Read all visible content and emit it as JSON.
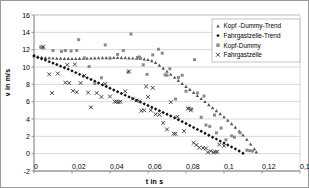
{
  "chart_data": {
    "type": "scatter",
    "title": "",
    "xlabel": "t in s",
    "ylabel": "v in m/s",
    "xlim": [
      0,
      0.14
    ],
    "ylim": [
      -2,
      16
    ],
    "xticks": [
      "0",
      "0,02",
      "0,04",
      "0,06",
      "0,08",
      "0,1",
      "0,12",
      "0,14"
    ],
    "xtick_values": [
      0,
      0.02,
      0.04,
      0.06,
      0.08,
      0.1,
      0.12,
      0.14
    ],
    "yticks": [
      "-2",
      "0",
      "2",
      "4",
      "6",
      "8",
      "10",
      "12",
      "14",
      "16"
    ],
    "ytick_values": [
      -2,
      0,
      2,
      4,
      6,
      8,
      10,
      12,
      14,
      16
    ],
    "grid": "horizontal",
    "legend_position": "top-right",
    "decimal_separator": ",",
    "series": [
      {
        "name": "Kopf-Dummy-Trend",
        "marker": "triangle",
        "color": "#555555",
        "points": [
          [
            0.0,
            11.3
          ],
          [
            0.002,
            11.2
          ],
          [
            0.004,
            11.12
          ],
          [
            0.006,
            11.08
          ],
          [
            0.008,
            11.05
          ],
          [
            0.01,
            11.02
          ],
          [
            0.012,
            11.0
          ],
          [
            0.014,
            11.0
          ],
          [
            0.016,
            10.98
          ],
          [
            0.018,
            10.98
          ],
          [
            0.02,
            10.97
          ],
          [
            0.022,
            10.97
          ],
          [
            0.024,
            10.98
          ],
          [
            0.026,
            10.99
          ],
          [
            0.028,
            11.0
          ],
          [
            0.03,
            11.02
          ],
          [
            0.032,
            11.03
          ],
          [
            0.034,
            11.05
          ],
          [
            0.036,
            11.06
          ],
          [
            0.038,
            11.07
          ],
          [
            0.04,
            11.08
          ],
          [
            0.042,
            11.08
          ],
          [
            0.044,
            11.08
          ],
          [
            0.046,
            11.07
          ],
          [
            0.048,
            11.06
          ],
          [
            0.05,
            11.04
          ],
          [
            0.052,
            11.02
          ],
          [
            0.054,
            11.0
          ],
          [
            0.056,
            10.97
          ],
          [
            0.058,
            10.92
          ],
          [
            0.06,
            10.85
          ],
          [
            0.062,
            10.72
          ],
          [
            0.064,
            10.5
          ],
          [
            0.066,
            10.2
          ],
          [
            0.068,
            9.85
          ],
          [
            0.07,
            9.5
          ],
          [
            0.072,
            9.15
          ],
          [
            0.074,
            8.8
          ],
          [
            0.076,
            8.45
          ],
          [
            0.078,
            8.1
          ],
          [
            0.08,
            7.75
          ],
          [
            0.082,
            7.4
          ],
          [
            0.084,
            7.05
          ],
          [
            0.086,
            6.7
          ],
          [
            0.088,
            6.35
          ],
          [
            0.09,
            6.0
          ],
          [
            0.092,
            5.65
          ],
          [
            0.094,
            5.3
          ],
          [
            0.096,
            4.95
          ],
          [
            0.098,
            4.6
          ],
          [
            0.1,
            4.25
          ],
          [
            0.102,
            3.85
          ],
          [
            0.104,
            3.45
          ],
          [
            0.106,
            3.05
          ],
          [
            0.108,
            2.6
          ],
          [
            0.11,
            2.15
          ],
          [
            0.112,
            1.65
          ],
          [
            0.114,
            1.1
          ],
          [
            0.116,
            0.55
          ],
          [
            0.117,
            0.2
          ]
        ]
      },
      {
        "name": "Fahrgastzelle-Trend",
        "marker": "diamond",
        "color": "#111111",
        "points": [
          [
            0.0,
            11.3
          ],
          [
            0.002,
            11.1
          ],
          [
            0.004,
            10.95
          ],
          [
            0.006,
            10.8
          ],
          [
            0.008,
            10.62
          ],
          [
            0.01,
            10.45
          ],
          [
            0.012,
            10.28
          ],
          [
            0.014,
            10.1
          ],
          [
            0.016,
            9.92
          ],
          [
            0.018,
            9.75
          ],
          [
            0.02,
            9.55
          ],
          [
            0.022,
            9.35
          ],
          [
            0.024,
            9.15
          ],
          [
            0.026,
            8.95
          ],
          [
            0.028,
            8.75
          ],
          [
            0.03,
            8.55
          ],
          [
            0.032,
            8.35
          ],
          [
            0.034,
            8.15
          ],
          [
            0.036,
            7.95
          ],
          [
            0.038,
            7.75
          ],
          [
            0.04,
            7.55
          ],
          [
            0.042,
            7.35
          ],
          [
            0.044,
            7.15
          ],
          [
            0.046,
            6.95
          ],
          [
            0.048,
            6.75
          ],
          [
            0.05,
            6.55
          ],
          [
            0.052,
            6.35
          ],
          [
            0.054,
            6.15
          ],
          [
            0.056,
            5.95
          ],
          [
            0.058,
            5.75
          ],
          [
            0.06,
            5.55
          ],
          [
            0.062,
            5.35
          ],
          [
            0.064,
            5.15
          ],
          [
            0.066,
            4.95
          ],
          [
            0.068,
            4.75
          ],
          [
            0.07,
            4.55
          ],
          [
            0.072,
            4.35
          ],
          [
            0.074,
            4.15
          ],
          [
            0.076,
            3.92
          ],
          [
            0.078,
            3.7
          ],
          [
            0.08,
            3.48
          ],
          [
            0.082,
            3.25
          ],
          [
            0.084,
            3.02
          ],
          [
            0.086,
            2.8
          ],
          [
            0.088,
            2.58
          ],
          [
            0.09,
            2.35
          ],
          [
            0.092,
            2.12
          ],
          [
            0.094,
            1.9
          ],
          [
            0.096,
            1.68
          ],
          [
            0.098,
            1.45
          ],
          [
            0.1,
            1.22
          ],
          [
            0.102,
            1.0
          ],
          [
            0.104,
            0.78
          ],
          [
            0.106,
            0.55
          ],
          [
            0.108,
            0.3
          ],
          [
            0.11,
            0.05
          ]
        ]
      },
      {
        "name": "Kopf-Dummy",
        "marker": "square",
        "color": "#8a8a8a",
        "points": [
          [
            0.0035,
            12.3
          ],
          [
            0.0042,
            12.25
          ],
          [
            0.0048,
            12.2
          ],
          [
            0.01,
            11.9
          ],
          [
            0.0145,
            11.8
          ],
          [
            0.0165,
            11.9
          ],
          [
            0.0195,
            11.85
          ],
          [
            0.0225,
            11.9
          ],
          [
            0.0235,
            13.15
          ],
          [
            0.0265,
            11.05
          ],
          [
            0.029,
            10.05
          ],
          [
            0.032,
            8.1
          ],
          [
            0.0355,
            8.75
          ],
          [
            0.0375,
            12.55
          ],
          [
            0.04,
            11.0
          ],
          [
            0.044,
            11.45
          ],
          [
            0.047,
            11.9
          ],
          [
            0.0495,
            9.4
          ],
          [
            0.051,
            13.8
          ],
          [
            0.0545,
            11.1
          ],
          [
            0.0555,
            11.15
          ],
          [
            0.056,
            11.0
          ],
          [
            0.0575,
            10.25
          ],
          [
            0.0595,
            9.15
          ],
          [
            0.0625,
            11.4
          ],
          [
            0.0655,
            12.05
          ],
          [
            0.0675,
            11.6
          ],
          [
            0.069,
            9.1
          ],
          [
            0.07,
            9.05
          ],
          [
            0.0715,
            9.8
          ],
          [
            0.0745,
            6.3
          ],
          [
            0.076,
            8.8
          ],
          [
            0.078,
            9.05
          ],
          [
            0.08,
            7.2
          ],
          [
            0.0815,
            5.25
          ],
          [
            0.083,
            5.15
          ],
          [
            0.0845,
            10.85
          ],
          [
            0.086,
            7.0
          ],
          [
            0.088,
            4.2
          ],
          [
            0.0895,
            6.65
          ],
          [
            0.0905,
            3.3
          ],
          [
            0.0925,
            3.15
          ],
          [
            0.095,
            4.45
          ],
          [
            0.096,
            2.4
          ],
          [
            0.0985,
            2.95
          ],
          [
            0.101,
            1.6
          ],
          [
            0.104,
            2.05
          ],
          [
            0.1055,
            1.9
          ],
          [
            0.1085,
            2.4
          ],
          [
            0.112,
            0.4
          ],
          [
            0.1135,
            0.35
          ],
          [
            0.115,
            0.3
          ]
        ]
      },
      {
        "name": "Fahrgastzelle",
        "marker": "cross",
        "color": "#333333",
        "points": [
          [
            0.0048,
            12.35
          ],
          [
            0.008,
            9.15
          ],
          [
            0.0095,
            7.0
          ],
          [
            0.0125,
            9.25
          ],
          [
            0.0165,
            8.2
          ],
          [
            0.0175,
            10.25
          ],
          [
            0.0185,
            8.15
          ],
          [
            0.0205,
            7.25
          ],
          [
            0.0215,
            10.3
          ],
          [
            0.0225,
            7.1
          ],
          [
            0.0245,
            8.15
          ],
          [
            0.0265,
            9.0
          ],
          [
            0.0285,
            7.05
          ],
          [
            0.03,
            5.35
          ],
          [
            0.033,
            7.0
          ],
          [
            0.0355,
            6.55
          ],
          [
            0.0375,
            8.05
          ],
          [
            0.04,
            6.6
          ],
          [
            0.0425,
            6.0
          ],
          [
            0.0435,
            6.0
          ],
          [
            0.0445,
            5.95
          ],
          [
            0.0455,
            6.0
          ],
          [
            0.048,
            7.2
          ],
          [
            0.05,
            9.5
          ],
          [
            0.052,
            6.35
          ],
          [
            0.054,
            6.15
          ],
          [
            0.0555,
            6.05
          ],
          [
            0.0565,
            4.95
          ],
          [
            0.058,
            5.0
          ],
          [
            0.059,
            7.75
          ],
          [
            0.06,
            6.55
          ],
          [
            0.0615,
            5.0
          ],
          [
            0.0625,
            7.6
          ],
          [
            0.064,
            4.55
          ],
          [
            0.066,
            4.5
          ],
          [
            0.068,
            3.55
          ],
          [
            0.07,
            2.8
          ],
          [
            0.072,
            5.95
          ],
          [
            0.0735,
            2.3
          ],
          [
            0.0745,
            2.3
          ],
          [
            0.0755,
            4.25
          ],
          [
            0.079,
            2.6
          ],
          [
            0.081,
            5.2
          ],
          [
            0.0825,
            5.0
          ],
          [
            0.084,
            1.25
          ],
          [
            0.0855,
            1.0
          ],
          [
            0.087,
            0.7
          ],
          [
            0.089,
            0.65
          ],
          [
            0.0905,
            0.6
          ],
          [
            0.0915,
            0.15
          ],
          [
            0.093,
            0.3
          ],
          [
            0.0945,
            0.15
          ],
          [
            0.0955,
            0.2
          ],
          [
            0.0965,
            0.2
          ],
          [
            0.0975,
            1.05
          ],
          [
            0.1,
            0.9
          ]
        ]
      }
    ],
    "legend_entries": [
      {
        "label": "Kopf -Dummy-Trend",
        "marker": "triangle",
        "color": "#555555"
      },
      {
        "label": "Fahrgastzelle-Trend",
        "marker": "diamond",
        "color": "#111111"
      },
      {
        "label": "Kopf-Dummy",
        "marker": "square",
        "color": "#8a8a8a"
      },
      {
        "label": "Fahrgastzelle",
        "marker": "cross",
        "color": "#333333"
      }
    ],
    "colors": {
      "grid": "#bdbdbd",
      "axis": "#808080",
      "frame": "#9a9a9a",
      "text": "#000000"
    }
  }
}
